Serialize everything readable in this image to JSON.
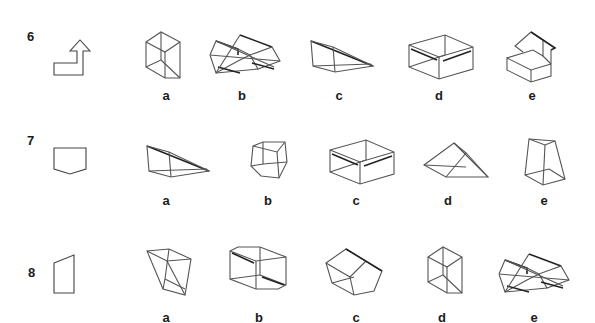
{
  "questions": [
    {
      "number": "6",
      "net_shape": "arrow-L-net",
      "options": [
        {
          "label": "a",
          "shape": "rectangular-prism-tall"
        },
        {
          "label": "b",
          "shape": "double-hexagonal-prism"
        },
        {
          "label": "c",
          "shape": "wedge-prism"
        },
        {
          "label": "d",
          "shape": "rounded-box"
        },
        {
          "label": "e",
          "shape": "house-step-prism"
        }
      ]
    },
    {
      "number": "7",
      "net_shape": "pentagon-net",
      "options": [
        {
          "label": "a",
          "shape": "wedge-prism"
        },
        {
          "label": "b",
          "shape": "pentagonal-prism"
        },
        {
          "label": "c",
          "shape": "rounded-box"
        },
        {
          "label": "d",
          "shape": "triangular-prism"
        },
        {
          "label": "e",
          "shape": "trapezoid-prism"
        }
      ]
    },
    {
      "number": "8",
      "net_shape": "trapezoid-net",
      "options": [
        {
          "label": "a",
          "shape": "trapezoid-prism"
        },
        {
          "label": "b",
          "shape": "octagonal-prism"
        },
        {
          "label": "c",
          "shape": "pentagonal-prism-tilted"
        },
        {
          "label": "d",
          "shape": "rectangular-prism-tall"
        },
        {
          "label": "e",
          "shape": "double-hexagonal-prism"
        }
      ]
    }
  ]
}
